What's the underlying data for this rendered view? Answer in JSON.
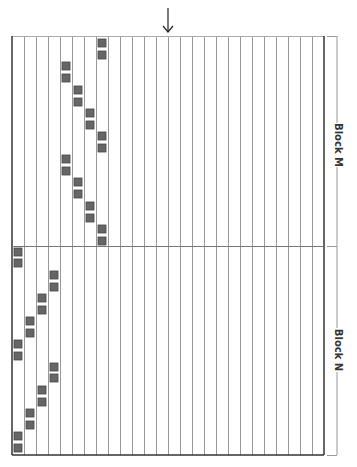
{
  "figure": {
    "arrow": {
      "x": 168,
      "y1": 8,
      "y2": 32,
      "direction": "down"
    },
    "grid": {
      "left": 12,
      "top": 36,
      "right": 324,
      "bottom": 455,
      "columns": 26,
      "col_width": 12,
      "divider_y": 246,
      "line_color": "#999999",
      "border_color": "#333333"
    },
    "square": {
      "size": 8,
      "fill": "#666666",
      "stroke": "#444444"
    },
    "blocks": [
      {
        "label": "Block M",
        "y_start": 36,
        "y_end": 246,
        "label_y": 145,
        "squares": [
          {
            "col": 7,
            "y": 43
          },
          {
            "col": 7,
            "y": 55
          },
          {
            "col": 4,
            "y": 66
          },
          {
            "col": 4,
            "y": 78
          },
          {
            "col": 5,
            "y": 90
          },
          {
            "col": 5,
            "y": 102
          },
          {
            "col": 6,
            "y": 113
          },
          {
            "col": 6,
            "y": 125
          },
          {
            "col": 7,
            "y": 136
          },
          {
            "col": 7,
            "y": 148
          },
          {
            "col": 4,
            "y": 159
          },
          {
            "col": 4,
            "y": 171
          },
          {
            "col": 5,
            "y": 182
          },
          {
            "col": 5,
            "y": 194
          },
          {
            "col": 6,
            "y": 206
          },
          {
            "col": 6,
            "y": 218
          },
          {
            "col": 7,
            "y": 229
          },
          {
            "col": 7,
            "y": 241
          }
        ]
      },
      {
        "label": "Block N",
        "y_start": 246,
        "y_end": 455,
        "label_y": 350,
        "squares": [
          {
            "col": 0,
            "y": 252
          },
          {
            "col": 0,
            "y": 263
          },
          {
            "col": 3,
            "y": 275
          },
          {
            "col": 3,
            "y": 287
          },
          {
            "col": 2,
            "y": 298
          },
          {
            "col": 2,
            "y": 310
          },
          {
            "col": 1,
            "y": 321
          },
          {
            "col": 1,
            "y": 333
          },
          {
            "col": 0,
            "y": 344
          },
          {
            "col": 0,
            "y": 356
          },
          {
            "col": 3,
            "y": 367
          },
          {
            "col": 3,
            "y": 378
          },
          {
            "col": 2,
            "y": 390
          },
          {
            "col": 2,
            "y": 402
          },
          {
            "col": 1,
            "y": 413
          },
          {
            "col": 1,
            "y": 425
          },
          {
            "col": 0,
            "y": 436
          },
          {
            "col": 0,
            "y": 448
          }
        ]
      }
    ],
    "bracket": {
      "x": 337,
      "tick_left": 327
    }
  }
}
